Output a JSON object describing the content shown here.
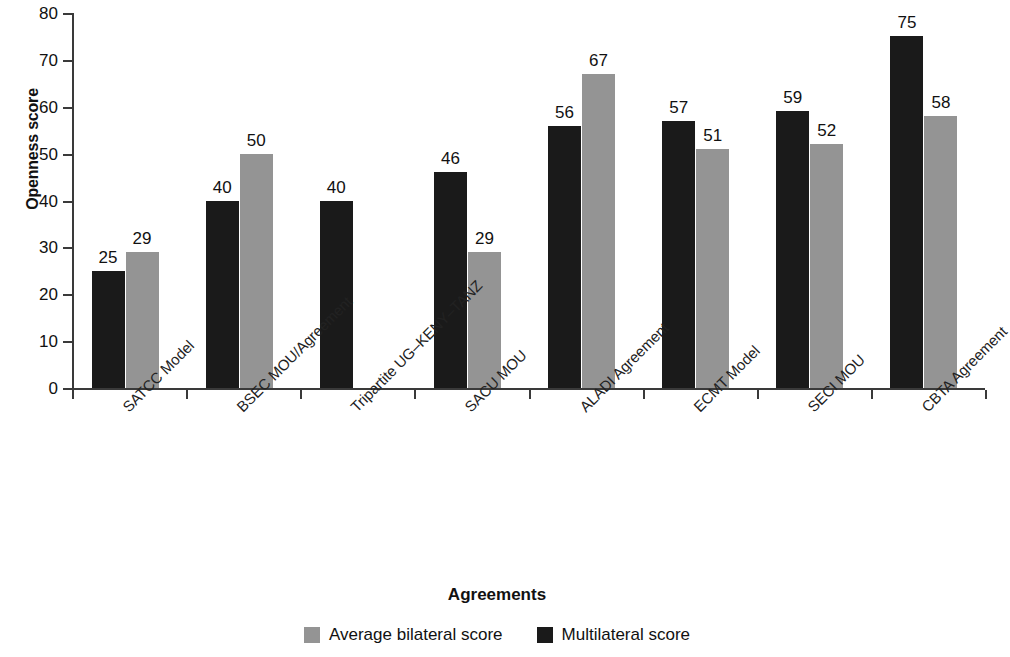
{
  "chart_data": {
    "type": "bar",
    "title": "",
    "xlabel": "Agreements",
    "ylabel": "Openness score",
    "ylim": [
      0,
      80
    ],
    "yticks": [
      0,
      10,
      20,
      30,
      40,
      50,
      60,
      70,
      80
    ],
    "grid": false,
    "legend_position": "bottom",
    "categories": [
      "SATCC Model",
      "BSEC MOU/Agreement",
      "Tripartite UG–KENY–TANZ",
      "SACU MOU",
      "ALADI Agreement",
      "ECMT Model",
      "SECI MOU",
      "CBTA Agreement"
    ],
    "series": [
      {
        "name": "Multilateral score",
        "color": "#1a1a1a",
        "values": [
          25,
          40,
          40,
          46,
          56,
          57,
          59,
          75
        ]
      },
      {
        "name": "Average bilateral score",
        "color": "#949494",
        "values": [
          29,
          50,
          null,
          29,
          67,
          51,
          52,
          58
        ]
      }
    ],
    "legend": [
      {
        "label": "Average bilateral score",
        "color": "#949494",
        "swatch": "bilateral"
      },
      {
        "label": "Multilateral score",
        "color": "#1a1a1a",
        "swatch": "multilateral"
      }
    ]
  }
}
